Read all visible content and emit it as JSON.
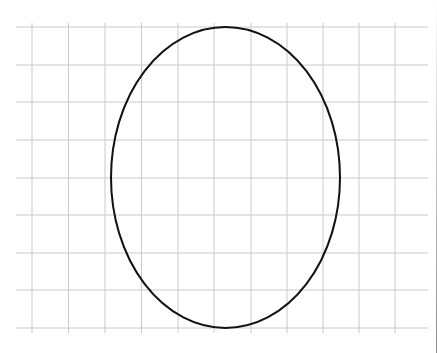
{
  "diagram": {
    "type": "ellipse-on-grid",
    "background": "#ffffff",
    "grid": {
      "color": "#c9c9c9",
      "stroke_width": 1,
      "vertical_lines_x": [
        32,
        68.5,
        105,
        141.5,
        178,
        214,
        251,
        287,
        323,
        359,
        395
      ],
      "vertical_y_range": [
        23,
        333
      ],
      "horizontal_lines_y": [
        27,
        65,
        102,
        140,
        178,
        215,
        253,
        290,
        328
      ],
      "horizontal_x_range": [
        16,
        428
      ]
    },
    "ellipse": {
      "cx": 225.5,
      "cy": 177.5,
      "rx": 114.5,
      "ry": 150.5,
      "stroke": "#111111",
      "stroke_width": 2,
      "fill": "none"
    }
  }
}
